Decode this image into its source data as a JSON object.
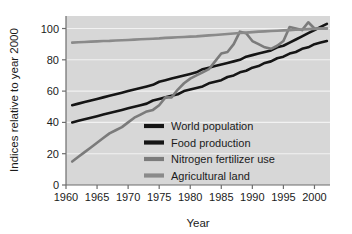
{
  "chart_data": {
    "type": "line",
    "title": "",
    "xlabel": "Year",
    "ylabel": "Indices relative to year 2000",
    "xlim": [
      1960,
      2002.5
    ],
    "ylim": [
      0,
      108
    ],
    "xticks": [
      1960,
      1965,
      1970,
      1975,
      1980,
      1985,
      1990,
      1995,
      2000
    ],
    "yticks": [
      0,
      20,
      40,
      60,
      80,
      100
    ],
    "grid": "horizontal-white-gridlines",
    "plot_background": "#d7d7d7",
    "figure_background": "#ffffff",
    "legend_position": "inside-lower-right",
    "x": [
      1961,
      1962,
      1963,
      1964,
      1965,
      1966,
      1967,
      1968,
      1969,
      1970,
      1971,
      1972,
      1973,
      1974,
      1975,
      1976,
      1977,
      1978,
      1979,
      1980,
      1981,
      1982,
      1983,
      1984,
      1985,
      1986,
      1987,
      1988,
      1989,
      1990,
      1991,
      1992,
      1993,
      1994,
      1995,
      1996,
      1997,
      1998,
      1999,
      2000,
      2001,
      2002
    ],
    "series": [
      {
        "name": "World population",
        "color": "#151515",
        "width": 2.6,
        "values": [
          40,
          41,
          42,
          43,
          44,
          45,
          46,
          47,
          48,
          49,
          50,
          51,
          52,
          54,
          55,
          56,
          57,
          58,
          60,
          61,
          62,
          63,
          65,
          66,
          67,
          69,
          70,
          72,
          73,
          75,
          76,
          78,
          79,
          81,
          82,
          84,
          85,
          87,
          88,
          90,
          91,
          92
        ],
        "note": "smooth near-linear rise from 40 to ~92"
      },
      {
        "name": "Food production",
        "color": "#151515",
        "width": 2.6,
        "values": [
          51,
          52,
          53,
          54,
          55,
          56,
          57,
          58,
          59,
          60,
          61,
          62,
          63,
          64,
          66,
          67,
          68,
          69,
          70,
          71,
          72,
          74,
          75,
          76,
          77,
          78,
          79,
          80,
          82,
          83,
          84,
          85,
          86,
          88,
          89,
          91,
          93,
          95,
          97,
          99,
          101,
          103
        ],
        "note": "straight steady climb from 51 to ~103, crosses 100 near 2000"
      },
      {
        "name": "Nitrogen fertilizer use",
        "color": "#7b7b7b",
        "width": 2.6,
        "values": [
          15,
          18,
          21,
          24,
          27,
          30,
          33,
          35,
          37,
          40,
          43,
          45,
          47,
          48,
          51,
          56,
          56,
          61,
          65,
          68,
          70,
          72,
          74,
          79,
          84,
          85,
          90,
          98,
          97,
          92,
          90,
          88,
          87,
          89,
          92,
          101,
          100,
          99,
          104,
          100,
          100,
          100
        ],
        "note": "steepest curve; peak ~98 at 1988, dip to ~87 in 1993, spikes ~104 in 1999"
      },
      {
        "name": "Agricultural land",
        "color": "#8a8a8a",
        "width": 2.6,
        "values": [
          91,
          91.2,
          91.4,
          91.6,
          91.8,
          92,
          92.1,
          92.3,
          92.5,
          92.7,
          92.9,
          93.1,
          93.3,
          93.5,
          93.7,
          94,
          94.2,
          94.4,
          94.6,
          94.8,
          95,
          95.3,
          95.6,
          95.9,
          96.2,
          96.5,
          96.8,
          97.1,
          97.4,
          97.7,
          98,
          98.2,
          98.4,
          98.6,
          98.8,
          99,
          99.2,
          99.4,
          99.6,
          99.8,
          100,
          100
        ],
        "note": "nearly flat slow rise from 91 to 100"
      }
    ]
  },
  "legend": {
    "items": [
      {
        "label": "World population",
        "color": "#151515"
      },
      {
        "label": "Food production",
        "color": "#151515"
      },
      {
        "label": "Nitrogen fertilizer use",
        "color": "#7b7b7b"
      },
      {
        "label": "Agricultural land",
        "color": "#8a8a8a"
      }
    ]
  },
  "axes": {
    "y_title": "Indices relative to year 2000",
    "x_title": "Year",
    "y_tick_labels": [
      "0",
      "20",
      "40",
      "60",
      "80",
      "100"
    ],
    "x_tick_labels": [
      "1960",
      "1965",
      "1970",
      "1975",
      "1980",
      "1985",
      "1990",
      "1995",
      "2000"
    ]
  }
}
